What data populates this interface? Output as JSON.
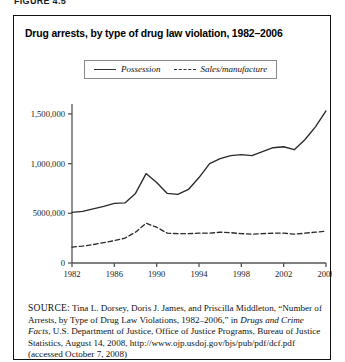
{
  "figure": {
    "label": "FIGURE 4.5",
    "title": "Drug arrests, by type of drug law violation, 1982–2006"
  },
  "legend": {
    "position": "top-center",
    "items": [
      {
        "label": "Possession",
        "style": "solid"
      },
      {
        "label": "Sales/manufacture",
        "style": "dashed"
      }
    ]
  },
  "source": {
    "prefix": "SOURCE:",
    "line1": " Tina L. Dorsey, Doris J. James, and Priscilla Middleton, “Number of Arrests, by Type of Drug Law Violations, 1982–2006,” in ",
    "italic_title": "Drugs and Crime Facts",
    "line2": ", U.S. Department of Justice, Office of Justice Programs, Bureau of Justice Statistics, August 14, 2008, http://www.ojp.usdoj.gov/bjs/pub/pdf/dcf.pdf (accessed October 7, 2008)"
  },
  "chart_data": {
    "type": "line",
    "title": "Drug arrests, by type of drug law violation, 1982–2006",
    "xlabel": "",
    "ylabel": "",
    "xlim": [
      1982,
      2006
    ],
    "ylim": [
      0,
      1600000
    ],
    "grid": false,
    "legend_position": "top-center",
    "ytick_labels": [
      "0",
      "5000,000",
      "1,000,000",
      "1,500,000"
    ],
    "ytick_values": [
      0,
      500000,
      1000000,
      1500000
    ],
    "xtick_labels": [
      "1982",
      "1986",
      "1990",
      "1994",
      "1998",
      "2002",
      "2006"
    ],
    "xtick_values": [
      1982,
      1986,
      1990,
      1994,
      1998,
      2002,
      2006
    ],
    "x": [
      1982,
      1983,
      1984,
      1985,
      1986,
      1987,
      1988,
      1989,
      1990,
      1991,
      1992,
      1993,
      1994,
      1995,
      1996,
      1997,
      1998,
      1999,
      2000,
      2001,
      2002,
      2003,
      2004,
      2005,
      2006
    ],
    "series": [
      {
        "name": "Possession",
        "style": "solid",
        "color": "#2a2a2a",
        "values": [
          510000,
          520000,
          545000,
          570000,
          600000,
          605000,
          700000,
          900000,
          810000,
          700000,
          690000,
          740000,
          860000,
          1000000,
          1050000,
          1080000,
          1090000,
          1080000,
          1120000,
          1160000,
          1170000,
          1140000,
          1240000,
          1370000,
          1530000
        ]
      },
      {
        "name": "Sales/manufacture",
        "style": "dashed",
        "color": "#2a2a2a",
        "values": [
          160000,
          170000,
          185000,
          205000,
          225000,
          250000,
          310000,
          400000,
          360000,
          300000,
          295000,
          295000,
          300000,
          300000,
          310000,
          305000,
          295000,
          290000,
          295000,
          300000,
          300000,
          290000,
          300000,
          310000,
          320000
        ]
      }
    ]
  }
}
